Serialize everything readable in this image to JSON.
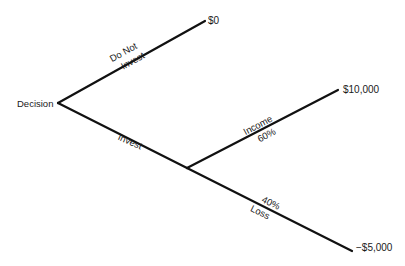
{
  "diagram": {
    "type": "decision-tree",
    "root": {
      "label": "Decision"
    },
    "branches": {
      "do_not_invest": {
        "label_line1": "Do Not",
        "label_line2": "Invest",
        "outcome": "$0"
      },
      "invest": {
        "label": "Invest",
        "chance_outcomes": {
          "income": {
            "label": "Income",
            "probability": "60%",
            "outcome": "$10,000"
          },
          "loss": {
            "label": "Loss",
            "probability": "40%",
            "outcome": "−$5,000"
          }
        }
      }
    },
    "colors": {
      "line": "#111111",
      "text": "#1a1a1a",
      "background": "#ffffff"
    }
  }
}
